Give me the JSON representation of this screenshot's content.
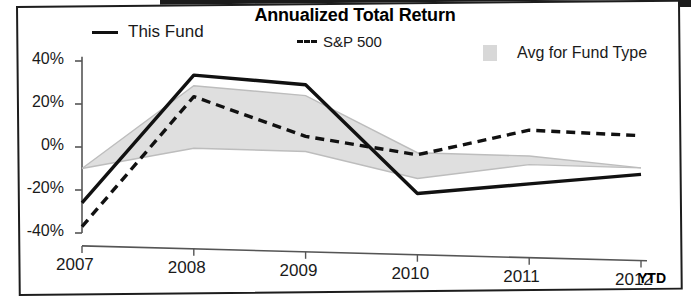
{
  "chart_data": {
    "type": "line",
    "title": "Annualized Total Return",
    "xlabel": "",
    "ylabel": "",
    "categories": [
      "2007",
      "2008",
      "2009",
      "2010",
      "2011",
      "2012"
    ],
    "x_axis_suffix": "YTD",
    "ytick_labels": [
      "40%",
      "20%",
      "0%",
      "-20%",
      "-40%"
    ],
    "ytick_values": [
      40,
      20,
      0,
      -20,
      -40
    ],
    "ylim": [
      -45,
      45
    ],
    "grid": false,
    "legend_position": "top",
    "series": [
      {
        "name": "This Fund",
        "style": "solid",
        "color": "#111111",
        "values": [
          -26,
          34,
          30,
          -20,
          -15,
          -10
        ]
      },
      {
        "name": "S&P 500",
        "style": "dashed",
        "color": "#111111",
        "values": [
          -37,
          24,
          6,
          -2,
          10,
          8
        ]
      },
      {
        "name": "Avg for Fund Type",
        "style": "area",
        "color": "#d8d8d8",
        "upper": [
          -10,
          29,
          25,
          -1,
          -2,
          -7
        ],
        "lower": [
          -10,
          0,
          -1,
          -13,
          -6,
          -7
        ]
      }
    ]
  },
  "legend": {
    "this_fund": "This Fund",
    "sp500": "S&P 500",
    "avg_fund_type": "Avg for Fund Type"
  },
  "colors": {
    "line": "#111111",
    "area_fill": "#dcdcdc",
    "area_stroke": "#bdbdbd",
    "axis": "#555555",
    "frame": "#1d1d1d"
  }
}
